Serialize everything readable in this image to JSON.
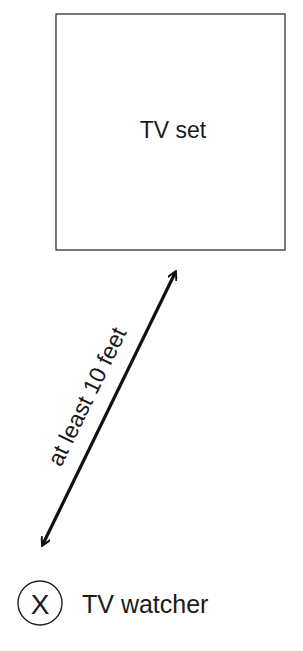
{
  "diagram": {
    "tv_box": {
      "label": "TV set"
    },
    "distance_arrow": {
      "label": "at least 10 feet"
    },
    "watcher": {
      "symbol": "X",
      "label": "TV watcher"
    }
  }
}
